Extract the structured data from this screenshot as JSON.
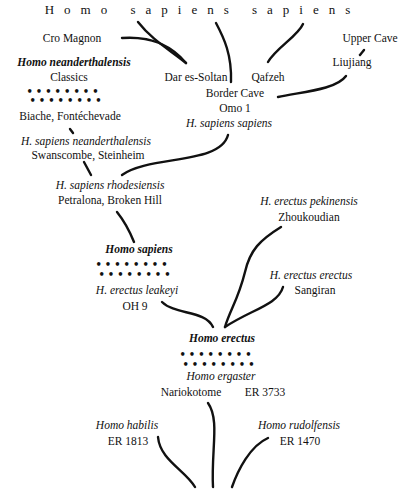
{
  "title": "Homo sapiens sapiens",
  "nodes": {
    "cro_magnon": "Cro Magnon",
    "upper_cave": "Upper Cave",
    "homo_neanderthalensis": "Homo neanderthalensis",
    "classics": "Classics",
    "dar_es_soltan": "Dar es-Soltan",
    "qafzeh": "Qafzeh",
    "liujiang": "Liujiang",
    "border_cave": "Border Cave",
    "omo1": "Omo 1",
    "h_sapiens_sapiens": "H. sapiens sapiens",
    "biache": "Biache, Fontéchevade",
    "h_sapiens_neanderthalensis": "H. sapiens neanderthalensis",
    "swanscombe": "Swanscombe, Steinheim",
    "h_sapiens_rhodesiensis": "H. sapiens rhodesiensis",
    "petralona": "Petralona,  Broken Hill",
    "h_erectus_pekinensis": "H. erectus pekinensis",
    "zhoukoudian": "Zhoukoudian",
    "homo_sapiens": "Homo sapiens",
    "h_erectus_erectus": "H. erectus erectus",
    "sangiran": "Sangiran",
    "h_erectus_leakeyi": "H. erectus leakeyi",
    "oh9": "OH 9",
    "homo_erectus": "Homo erectus",
    "homo_ergaster": "Homo ergaster",
    "nariokotome": "Nariokotome",
    "er3733": "ER 3733",
    "homo_habilis": "Homo habilis",
    "er1813": "ER 1813",
    "homo_rudolfensis": "Homo rudolfensis",
    "er1470": "ER 1470"
  },
  "separator": "••••••••"
}
